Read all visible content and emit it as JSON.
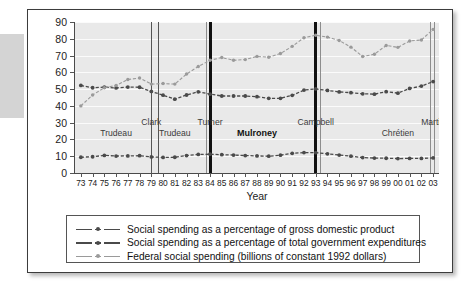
{
  "chart_data": {
    "type": "line",
    "title": "",
    "xlabel": "Year",
    "ylabel": "",
    "ylim": [
      0,
      90
    ],
    "ytick_step": 10,
    "grid": true,
    "legend_position": "bottom",
    "x": [
      "73",
      "74",
      "75",
      "76",
      "77",
      "78",
      "79",
      "80",
      "81",
      "82",
      "83",
      "84",
      "85",
      "86",
      "87",
      "88",
      "89",
      "90",
      "91",
      "92",
      "93",
      "94",
      "95",
      "96",
      "97",
      "98",
      "99",
      "00",
      "01",
      "02",
      "03"
    ],
    "yticks": [
      "0",
      "10",
      "20",
      "30",
      "40",
      "50",
      "60",
      "70",
      "80",
      "90"
    ],
    "series": [
      {
        "name": "Social spending as a percentage of gross domestic product",
        "color": "#4a4a4a",
        "values": [
          9.4,
          9.7,
          10.5,
          10.1,
          10.2,
          10.3,
          9.6,
          9.3,
          9.4,
          10.4,
          11.1,
          11.2,
          10.9,
          10.7,
          10.4,
          10.2,
          10.0,
          10.6,
          11.7,
          12.2,
          12.1,
          11.4,
          10.7,
          10.0,
          9.2,
          8.9,
          8.8,
          8.6,
          8.7,
          8.7,
          9.0
        ]
      },
      {
        "name": "Social spending as a percentage of total government expenditures",
        "color": "#4a4a4a",
        "values": [
          52.2,
          50.8,
          51.2,
          50.7,
          51.2,
          51.1,
          48.6,
          46.4,
          44.0,
          46.5,
          48.4,
          47.0,
          45.9,
          45.9,
          45.9,
          45.5,
          44.5,
          44.5,
          46.3,
          49.4,
          50.1,
          49.2,
          48.3,
          47.9,
          47.2,
          47.0,
          48.5,
          47.6,
          50.4,
          51.8,
          54.5
        ]
      },
      {
        "name": "Federal social spending (billions of constant 1992 dollars)",
        "color": "#9a9a9a",
        "values": [
          40.0,
          46.5,
          50.8,
          52.2,
          55.7,
          56.6,
          53.0,
          53.3,
          53.0,
          59.0,
          63.5,
          67.2,
          68.8,
          67.2,
          67.6,
          69.5,
          69.0,
          71.2,
          75.5,
          80.6,
          82.1,
          81.0,
          79.0,
          75.0,
          69.4,
          70.8,
          76.0,
          74.9,
          78.7,
          79.3,
          85.6
        ]
      }
    ],
    "annotations": [
      {
        "label": "Trudeau",
        "x": "76",
        "bold": false
      },
      {
        "label": "Clark",
        "x": "79",
        "bold": false
      },
      {
        "label": "Trudeau",
        "x": "81",
        "bold": false
      },
      {
        "label": "Turner",
        "x": "84",
        "bold": false
      },
      {
        "label": "Mulroney",
        "x": "88",
        "bold": true
      },
      {
        "label": "Campbell",
        "x": "93",
        "bold": false
      },
      {
        "label": "Chrétien",
        "x": "00",
        "bold": false
      },
      {
        "label": "Martin",
        "x": "03",
        "bold": false
      }
    ],
    "dividers": [
      {
        "x": "79",
        "style": "thin",
        "color": "#555555"
      },
      {
        "x": "79.6",
        "style": "thin",
        "color": "#555555"
      },
      {
        "x": "83.7",
        "style": "thin",
        "color": "#8d8d8d"
      },
      {
        "x": "84",
        "style": "thick",
        "color": "#111111"
      },
      {
        "x": "93",
        "style": "thick",
        "color": "#111111"
      },
      {
        "x": "93.4",
        "style": "thin",
        "color": "#8d8d8d"
      },
      {
        "x": "02.8",
        "style": "thin",
        "color": "#8d8d8d"
      },
      {
        "x": "03.1",
        "style": "thin",
        "color": "#8d8d8d"
      }
    ]
  },
  "legend": {
    "items": [
      {
        "label": "Social spending as a percentage of gross domestic product",
        "color": "#4a4a4a"
      },
      {
        "label": "Social spending as a percentage of total government expenditures",
        "color": "#4a4a4a"
      },
      {
        "label": "Federal social spending (billions of constant 1992 dollars)",
        "color": "#9a9a9a"
      }
    ]
  },
  "colors": {
    "plot_background": "#e9e9e9",
    "gridline": "#fbfbfb",
    "axis": "#4a4a4a",
    "series_dark": "#4a4a4a",
    "series_light": "#9a9a9a",
    "frame": "#3c3c3c"
  }
}
